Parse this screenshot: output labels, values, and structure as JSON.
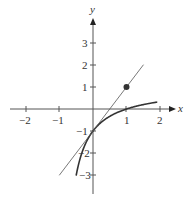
{
  "chart_data": {
    "type": "line",
    "title": "",
    "xlabel": "x",
    "ylabel": "y",
    "xlim": [
      -2.3,
      2.4
    ],
    "ylim": [
      -3.6,
      4
    ],
    "grid": false,
    "x_ticks": [
      -2,
      -1,
      1,
      2
    ],
    "x_tick_labels": [
      "−2",
      "−1",
      "1",
      "2"
    ],
    "y_ticks": [
      3,
      2,
      1,
      -1,
      -2,
      -3
    ],
    "y_tick_labels": [
      "3",
      "2",
      "1",
      "−1",
      "−2",
      "−3"
    ],
    "series": [
      {
        "name": "curve",
        "description": "f(x) = (x-1)/(x+1)",
        "x": [
          -0.5,
          -0.4,
          -0.3,
          -0.2,
          -0.1,
          0,
          0.2,
          0.4,
          0.6,
          0.8,
          1.0,
          1.2,
          1.4,
          1.6,
          1.8,
          1.9
        ],
        "y": [
          -3,
          -2.333,
          -1.857,
          -1.5,
          -1.222,
          -1,
          -0.667,
          -0.429,
          -0.25,
          -0.111,
          0,
          0.091,
          0.167,
          0.231,
          0.286,
          0.31
        ],
        "color": "#333333",
        "stroke_width": 1.6
      },
      {
        "name": "tangent line",
        "description": "y = 2x - 1",
        "x": [
          -1,
          1.5
        ],
        "y": [
          -3,
          2
        ],
        "color": "#555555",
        "stroke_width": 0.8
      }
    ],
    "points": [
      {
        "x": 1,
        "y": 1,
        "label": "",
        "color": "#333333"
      }
    ]
  }
}
